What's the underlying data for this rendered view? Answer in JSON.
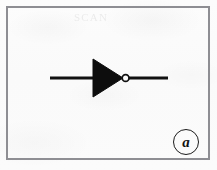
{
  "figure": {
    "kind": "logic-gate-symbol",
    "gate_type": "NOT",
    "gate_alias": "inverter",
    "sublabel": "a",
    "ghost_text": "SCAN",
    "frame": {
      "x": 6,
      "y": 6,
      "width": 204,
      "height": 154,
      "border_color": "#8e8e93",
      "border_width": 2
    },
    "colors": {
      "ink": "#111111",
      "paper": "#fbfbfb",
      "frame": "#8e8e93"
    },
    "geometry": {
      "wire_y": 78,
      "wire_thickness": 3,
      "input_wire": {
        "x1": 50,
        "x2": 93
      },
      "output_wire": {
        "x1": 128,
        "x2": 168
      },
      "triangle": {
        "left": 93,
        "top": 59,
        "bottom": 97,
        "apex_x": 123
      },
      "bubble": {
        "cx": 125.5,
        "cy": 78,
        "r": 3.4
      }
    }
  }
}
